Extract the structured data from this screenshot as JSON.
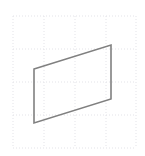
{
  "canvas": {
    "width": 145,
    "height": 156,
    "background_color": "#ffffff",
    "alt_text": "Parallelogram outline on a faint dotted grid"
  },
  "grid": {
    "visible": true,
    "style": "dotted",
    "line_color": "#e3e3e8",
    "line_width": 1,
    "dash_pattern": "1 2",
    "x_lines": [
      13,
      44,
      75,
      106,
      136
    ],
    "y_lines": [
      16,
      49,
      82,
      115,
      148
    ],
    "columns": 4,
    "rows": 4,
    "bounds": {
      "left": 13,
      "top": 16,
      "right": 136,
      "bottom": 148
    }
  },
  "shape": {
    "name": "parallelogram",
    "type": "polygon",
    "stroke_color": "#808080",
    "stroke_width": 1.6,
    "fill_color": "none",
    "vertex_labels": [
      "top-left",
      "top-right",
      "bottom-right",
      "bottom-left"
    ],
    "vertices": [
      {
        "x": 34,
        "y": 69
      },
      {
        "x": 111,
        "y": 45
      },
      {
        "x": 111,
        "y": 99
      },
      {
        "x": 34,
        "y": 123
      }
    ],
    "points_attr": "34,69 111,45 111,99 34,123",
    "edges": [
      {
        "name": "top-edge",
        "from": "top-left",
        "to": "top-right"
      },
      {
        "name": "right-edge",
        "from": "top-right",
        "to": "bottom-right"
      },
      {
        "name": "bottom-edge",
        "from": "bottom-right",
        "to": "bottom-left"
      },
      {
        "name": "left-edge",
        "from": "bottom-left",
        "to": "top-left"
      }
    ],
    "width_px": 77,
    "height_px": 54,
    "slant_offset_px": -24
  }
}
